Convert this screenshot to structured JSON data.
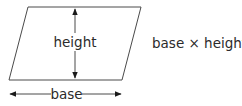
{
  "diagram": {
    "shape": "parallelogram",
    "labels": {
      "height": "height",
      "base": "base"
    },
    "formula": "base × height",
    "colors": {
      "stroke": "#4a4a4a",
      "text": "#2b2b2b",
      "background": "#ffffff"
    },
    "geometry": {
      "vertices": [
        [
          28,
          7
        ],
        [
          141,
          7
        ],
        [
          122,
          80
        ],
        [
          9,
          80
        ]
      ],
      "height_arrow": {
        "x": 75,
        "y1": 8,
        "y2": 79
      },
      "base_arrow": {
        "y": 94,
        "x1": 9,
        "x2": 122
      }
    }
  }
}
